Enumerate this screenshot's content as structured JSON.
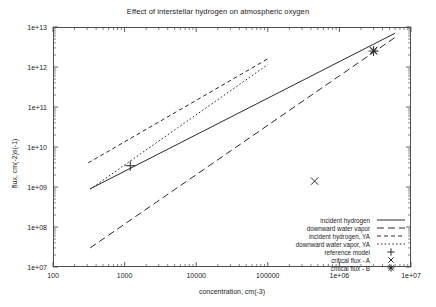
{
  "chart_data": {
    "type": "line",
    "title": "Effect of interstellar hydrogen on atmospheric oxygen",
    "xlabel": "concentration, cm(-3)",
    "ylabel": "flux, cm(-2)s(-1)",
    "xscale": "log",
    "yscale": "log",
    "xlim": [
      100,
      10000000
    ],
    "ylim": [
      10000000,
      10000000000000
    ],
    "grid": false,
    "legend_position": "bottom-right",
    "xticks": [
      "100",
      "1000",
      "10000",
      "100000",
      "1e+06",
      "1e+07"
    ],
    "xtick_values": [
      100,
      1000,
      10000,
      100000,
      1000000,
      10000000
    ],
    "yticks": [
      "1e+07",
      "1e+08",
      "1e+09",
      "1e+10",
      "1e+11",
      "1e+12",
      "1e+13"
    ],
    "ytick_values": [
      10000000,
      100000000,
      1000000000,
      10000000000,
      100000000000,
      1000000000000,
      10000000000000
    ],
    "series": [
      {
        "name": "incident hydrogen",
        "style": "solid",
        "x": [
          330,
          6000000
        ],
        "y": [
          900000000,
          7000000000000
        ]
      },
      {
        "name": "downward water vapor",
        "style": "long-dash",
        "x": [
          330,
          6000000
        ],
        "y": [
          30000000,
          5500000000000
        ]
      },
      {
        "name": "incident hydrogen, YA",
        "style": "short-dash",
        "x": [
          310,
          100000
        ],
        "y": [
          4000000000,
          1600000000000
        ]
      },
      {
        "name": "downward water vapor, YA",
        "style": "dotted",
        "x": [
          330,
          100000
        ],
        "y": [
          880000000,
          1150000000000
        ]
      }
    ],
    "markers": [
      {
        "name": "reference model",
        "symbol": "plus",
        "points": [
          {
            "x": 1200,
            "y": 3400000000
          }
        ]
      },
      {
        "name": "critical flux - A",
        "symbol": "cross",
        "points": [
          {
            "x": 450000,
            "y": 1400000000
          },
          {
            "x": 3000000,
            "y": 2600000000000
          }
        ]
      },
      {
        "name": "critical flux - B",
        "symbol": "star",
        "points": [
          {
            "x": 3000000,
            "y": 2500000000000
          }
        ]
      }
    ]
  },
  "legend": {
    "entries": [
      {
        "label": "incident hydrogen",
        "key": "solid"
      },
      {
        "label": "downward water vapor",
        "key": "long-dash"
      },
      {
        "label": "incident hydrogen, YA",
        "key": "short-dash"
      },
      {
        "label": "downward water vapor, YA",
        "key": "dotted"
      },
      {
        "label": "reference model",
        "key": "plus"
      },
      {
        "label": "critical flux - A",
        "key": "cross"
      },
      {
        "label": "critical flux - B",
        "key": "star"
      }
    ]
  },
  "colors": {
    "line": "#2a2a2a",
    "frame": "#4d4d4d",
    "text": "#1a1a1a",
    "background": "#ffffff"
  }
}
